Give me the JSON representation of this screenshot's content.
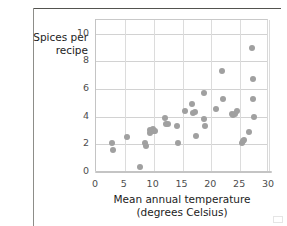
{
  "chart_data": {
    "type": "scatter",
    "title": "",
    "xlabel": "Mean annual temperature (degrees Celsius)",
    "xlabel_line1": "Mean annual temperature",
    "xlabel_line2": "(degrees Celsius)",
    "ylabel": "Spices per recipe",
    "ylabel_line1": "Spices per",
    "ylabel_line2": "recipe",
    "xlim": [
      0,
      30
    ],
    "ylim": [
      0,
      11
    ],
    "xticks": [
      0,
      5,
      10,
      15,
      20,
      25,
      30
    ],
    "yticks": [
      0,
      2,
      4,
      6,
      8,
      10
    ],
    "xtick_labels": [
      "0",
      "5",
      "10",
      "15",
      "20",
      "25",
      "30"
    ],
    "ytick_labels": [
      "0",
      "2",
      "4",
      "6",
      "8",
      "10"
    ],
    "grid": true,
    "grid_axis": "both",
    "legend": "none",
    "marker_color": "#a0a0a0",
    "marker_size": 6,
    "points": [
      {
        "x": 2.8,
        "y": 2.1
      },
      {
        "x": 2.9,
        "y": 1.6
      },
      {
        "x": 5.4,
        "y": 2.5
      },
      {
        "x": 7.7,
        "y": 0.35
      },
      {
        "x": 8.5,
        "y": 2.1
      },
      {
        "x": 8.6,
        "y": 1.85
      },
      {
        "x": 9.3,
        "y": 2.8
      },
      {
        "x": 9.4,
        "y": 3.05
      },
      {
        "x": 9.9,
        "y": 3.1
      },
      {
        "x": 10.1,
        "y": 2.95
      },
      {
        "x": 10.3,
        "y": 3.0
      },
      {
        "x": 11.9,
        "y": 3.9
      },
      {
        "x": 12.2,
        "y": 3.5
      },
      {
        "x": 12.4,
        "y": 3.45
      },
      {
        "x": 14.0,
        "y": 3.35
      },
      {
        "x": 14.2,
        "y": 2.1
      },
      {
        "x": 15.5,
        "y": 4.4
      },
      {
        "x": 16.7,
        "y": 4.9
      },
      {
        "x": 16.9,
        "y": 4.3
      },
      {
        "x": 17.1,
        "y": 4.35
      },
      {
        "x": 17.4,
        "y": 2.6
      },
      {
        "x": 18.7,
        "y": 5.7
      },
      {
        "x": 18.8,
        "y": 3.8
      },
      {
        "x": 18.9,
        "y": 3.3
      },
      {
        "x": 20.8,
        "y": 4.55
      },
      {
        "x": 21.8,
        "y": 7.3
      },
      {
        "x": 22.1,
        "y": 5.25
      },
      {
        "x": 23.6,
        "y": 4.2
      },
      {
        "x": 23.8,
        "y": 4.1
      },
      {
        "x": 24.1,
        "y": 4.2
      },
      {
        "x": 24.4,
        "y": 4.4
      },
      {
        "x": 25.3,
        "y": 2.1
      },
      {
        "x": 25.5,
        "y": 2.25
      },
      {
        "x": 25.7,
        "y": 2.35
      },
      {
        "x": 26.6,
        "y": 2.9
      },
      {
        "x": 27.1,
        "y": 9.0
      },
      {
        "x": 27.2,
        "y": 6.7
      },
      {
        "x": 27.3,
        "y": 5.25
      },
      {
        "x": 27.4,
        "y": 4.0
      }
    ]
  }
}
